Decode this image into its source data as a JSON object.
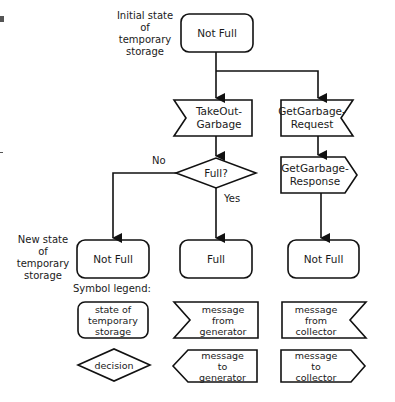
{
  "diagram": {
    "side_labels": {
      "initial": [
        "Initial state",
        "of",
        "temporary",
        "storage"
      ],
      "new": [
        "New state",
        "of",
        "temporary",
        "storage"
      ]
    },
    "nodes": {
      "initial_state": {
        "type": "state",
        "lines": [
          "Not Full"
        ]
      },
      "takeout_garbage": {
        "type": "message-from-generator",
        "lines": [
          "TakeOut-",
          "Garbage"
        ]
      },
      "get_garbage_request": {
        "type": "message-from-collector",
        "lines": [
          "GetGarbage-",
          "Request"
        ]
      },
      "full_decision": {
        "type": "decision",
        "lines": [
          "Full?"
        ]
      },
      "get_garbage_response": {
        "type": "message-to-collector",
        "lines": [
          "GetGarbage-",
          "Response"
        ]
      },
      "new_state_not_full_left": {
        "type": "state",
        "lines": [
          "Not Full"
        ]
      },
      "new_state_full": {
        "type": "state",
        "lines": [
          "Full"
        ]
      },
      "new_state_not_full_right": {
        "type": "state",
        "lines": [
          "Not Full"
        ]
      }
    },
    "edge_labels": {
      "no": "No",
      "yes": "Yes"
    },
    "edges": [
      {
        "from": "initial_state",
        "to": "takeout_garbage"
      },
      {
        "from": "initial_state",
        "to": "get_garbage_request"
      },
      {
        "from": "takeout_garbage",
        "to": "full_decision"
      },
      {
        "from": "full_decision",
        "to": "new_state_not_full_left",
        "label": "No"
      },
      {
        "from": "full_decision",
        "to": "new_state_full",
        "label": "Yes"
      },
      {
        "from": "get_garbage_request",
        "to": "get_garbage_response"
      },
      {
        "from": "get_garbage_response",
        "to": "new_state_not_full_right"
      }
    ],
    "legend": {
      "title": "Symbol legend:",
      "items": [
        {
          "shape": "rounded-rectangle",
          "lines": [
            "state of",
            "temporary",
            "storage"
          ]
        },
        {
          "shape": "notch-left",
          "lines": [
            "message",
            "from",
            "generator"
          ]
        },
        {
          "shape": "notch-right",
          "lines": [
            "message",
            "from",
            "collector"
          ]
        },
        {
          "shape": "diamond",
          "lines": [
            "decision"
          ]
        },
        {
          "shape": "point-left",
          "lines": [
            "message",
            "to",
            "generator"
          ]
        },
        {
          "shape": "point-right",
          "lines": [
            "message",
            "to",
            "collector"
          ]
        }
      ]
    }
  }
}
